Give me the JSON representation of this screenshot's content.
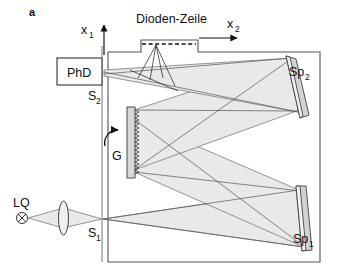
{
  "figure": {
    "panel_label": "a",
    "type": "optical-spectrometer-diagram"
  },
  "labels": {
    "light_source": "LQ",
    "entrance_slit": "S",
    "entrance_slit_sub": "1",
    "exit_slit": "S",
    "exit_slit_sub": "2",
    "photodiode": "PhD",
    "grating": "G",
    "mirror1": "Sp",
    "mirror1_sub": "1",
    "mirror2": "Sp",
    "mirror2_sub": "2",
    "diode_array": "Dioden-Zeile",
    "axis_x1": "x",
    "axis_x1_sub": "1",
    "axis_x2": "x",
    "axis_x2_sub": "2"
  },
  "components": [
    {
      "name": "light-source",
      "label": "LQ",
      "kind": "source"
    },
    {
      "name": "lens",
      "label": "",
      "kind": "lens"
    },
    {
      "name": "entrance-slit",
      "label": "S1",
      "kind": "slit"
    },
    {
      "name": "mirror-sp1",
      "label": "Sp1",
      "kind": "concave-mirror"
    },
    {
      "name": "grating",
      "label": "G",
      "kind": "blazed-grating"
    },
    {
      "name": "mirror-sp2",
      "label": "Sp2",
      "kind": "concave-mirror"
    },
    {
      "name": "exit-slit",
      "label": "S2",
      "kind": "slit"
    },
    {
      "name": "photodiode",
      "label": "PhD",
      "kind": "detector"
    },
    {
      "name": "diode-array",
      "label": "Dioden-Zeile",
      "kind": "detector-array"
    }
  ],
  "colors": {
    "beam_fill": "#e9e9e9",
    "beam_outline": "#555555",
    "frame": "#555555",
    "mirror_body": "#d2d2d2",
    "mirror_face": "#f2f2f2",
    "grating_body": "#d8d8d8",
    "text": "#111111",
    "background": "#ffffff"
  }
}
